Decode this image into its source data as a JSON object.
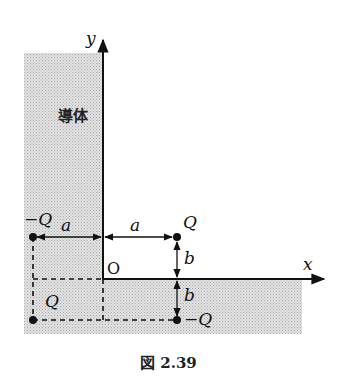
{
  "figure": {
    "caption": "図 2.39",
    "conductor_label": "導体",
    "axes": {
      "x_label": "x",
      "y_label": "y",
      "origin_label": "O"
    },
    "charges": [
      {
        "id": "real",
        "label": "Q",
        "position": "(a, b)",
        "sign": "+",
        "kind": "real"
      },
      {
        "id": "image-left",
        "label": "−Q",
        "position": "(−a, b)",
        "sign": "−",
        "kind": "image"
      },
      {
        "id": "image-bottom",
        "label": "−Q",
        "position": "(a, −b)",
        "sign": "−",
        "kind": "image"
      },
      {
        "id": "image-diag",
        "label": "Q",
        "position": "(−a, −b)",
        "sign": "+",
        "kind": "image"
      }
    ],
    "dimensions": {
      "horizontal": "a",
      "vertical": "b"
    },
    "colors": {
      "conductor_fill": "#d6d6d6",
      "ink": "#111111"
    }
  }
}
